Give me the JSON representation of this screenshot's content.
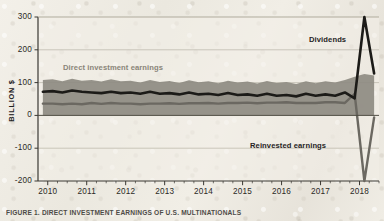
{
  "figure": {
    "caption_label": "FIGURE 1.",
    "caption_text": "DIRECT INVESTMENT EARNINGS OF U.S. MULTINATIONALS",
    "y_axis_title": "BILLION $"
  },
  "colors": {
    "paper": "#efece4",
    "plot_background": "#f2efe8",
    "area_fill": "#8e8b82",
    "dividends_line": "#1c1b18",
    "reinvested_line": "#6b6861",
    "gridline": "#b9b4a8",
    "axis": "#3a3833",
    "label_direct": "#8a8579",
    "label_dark": "#26241f"
  },
  "chart_data": {
    "type": "area",
    "title": "",
    "subtitle": "",
    "xlabel": "",
    "ylabel": "BILLION $",
    "ylim": [
      -200,
      300
    ],
    "xlim": [
      2009.75,
      2018.5
    ],
    "grid": true,
    "gridlines_y": [
      300,
      200,
      100,
      0,
      -100,
      -200
    ],
    "legend": "in-plot annotations",
    "y_ticks": [
      "300",
      "200",
      "100",
      "0",
      "-100",
      "-200"
    ],
    "y_tick_values": [
      300,
      200,
      100,
      0,
      -100,
      -200
    ],
    "x_ticks": [
      "2010",
      "2011",
      "2012",
      "2013",
      "2014",
      "2015",
      "2016",
      "2017",
      "2018"
    ],
    "x_tick_values": [
      2010,
      2011,
      2012,
      2013,
      2014,
      2015,
      2016,
      2017,
      2018
    ],
    "x_minor_tick_note": "quarterly minor ticks between year labels",
    "annotations": [
      {
        "text": "Direct investment earnings",
        "x": 2010.6,
        "y": 135
      },
      {
        "text": "Dividends",
        "x": 2017.3,
        "y": 232
      },
      {
        "text": "Reinvested earnings",
        "x": 2015.9,
        "y": -78
      }
    ],
    "x": [
      2009.875,
      2010.125,
      2010.375,
      2010.625,
      2010.875,
      2011.125,
      2011.375,
      2011.625,
      2011.875,
      2012.125,
      2012.375,
      2012.625,
      2012.875,
      2013.125,
      2013.375,
      2013.625,
      2013.875,
      2014.125,
      2014.375,
      2014.625,
      2014.875,
      2015.125,
      2015.375,
      2015.625,
      2015.875,
      2016.125,
      2016.375,
      2016.625,
      2016.875,
      2017.125,
      2017.375,
      2017.625,
      2017.875,
      2018.125,
      2018.375
    ],
    "series": [
      {
        "name": "Direct investment earnings",
        "role": "area",
        "color": "#8e8b82",
        "values": [
          108,
          110,
          104,
          112,
          106,
          108,
          103,
          110,
          104,
          106,
          100,
          108,
          102,
          105,
          99,
          107,
          101,
          104,
          98,
          106,
          100,
          103,
          97,
          105,
          99,
          102,
          96,
          104,
          98,
          104,
          100,
          108,
          118,
          126,
          122
        ]
      },
      {
        "name": "Dividends",
        "role": "line",
        "color": "#1c1b18",
        "values": [
          72,
          74,
          70,
          76,
          72,
          70,
          68,
          72,
          68,
          70,
          66,
          72,
          66,
          68,
          64,
          70,
          64,
          66,
          62,
          68,
          62,
          64,
          60,
          66,
          60,
          62,
          58,
          66,
          60,
          64,
          60,
          70,
          52,
          300,
          128
        ]
      },
      {
        "name": "Reinvested earnings",
        "role": "line",
        "color": "#6b6861",
        "values": [
          36,
          36,
          34,
          36,
          34,
          38,
          35,
          38,
          36,
          36,
          34,
          36,
          36,
          37,
          35,
          37,
          37,
          38,
          36,
          38,
          38,
          39,
          37,
          39,
          39,
          40,
          38,
          38,
          38,
          40,
          40,
          38,
          66,
          -200,
          -6
        ]
      }
    ]
  }
}
